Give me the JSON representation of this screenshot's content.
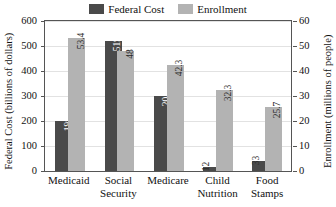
{
  "chart_data": {
    "type": "bar",
    "title": "",
    "categories": [
      "Medicaid",
      "Social Security",
      "Medicare",
      "Child Nutrition",
      "Food Stamps"
    ],
    "series": [
      {
        "name": "Federal Cost",
        "axis": "left",
        "color": "#4a4a4a",
        "values": [
          198,
          519,
          204,
          12,
          33
        ],
        "labels": [
          "198",
          "519",
          "204",
          "12",
          "33"
        ],
        "plotted": [
          200,
          522,
          299,
          17,
          42
        ]
      },
      {
        "name": "Enrollment",
        "axis": "right",
        "color": "#b3b3b3",
        "values": [
          53.4,
          48,
          42.3,
          32.3,
          25.7
        ],
        "labels": [
          "53.4",
          "48",
          "42.3",
          "32.3",
          "25.7"
        ],
        "plotted": [
          53.4,
          48,
          42.3,
          32.3,
          25.7
        ]
      }
    ],
    "xlabel": "",
    "ylabel": "Federal Cost (billions of dollars)",
    "y2label": "Enrollment (millions of people)",
    "ylim": [
      0,
      600
    ],
    "y2lim": [
      0,
      60
    ],
    "yticks": [
      "0",
      "100",
      "200",
      "300",
      "400",
      "500",
      "600"
    ],
    "y2ticks": [
      "0",
      "10",
      "20",
      "30",
      "40",
      "50",
      "60"
    ],
    "grid": true,
    "legend_position": "top-center"
  },
  "legend": {
    "entries": [
      {
        "label": "Federal Cost",
        "color": "#4a4a4a"
      },
      {
        "label": "Enrollment",
        "color": "#b3b3b3"
      }
    ]
  },
  "axes": {
    "left_title": "Federal Cost (billions of dollars)",
    "right_title": "Enrollment (millions of people)"
  },
  "categories_wrapped": [
    [
      "Medicaid",
      ""
    ],
    [
      "Social",
      "Security"
    ],
    [
      "Medicare",
      ""
    ],
    [
      "Child",
      "Nutrition"
    ],
    [
      "Food",
      "Stamps"
    ]
  ]
}
